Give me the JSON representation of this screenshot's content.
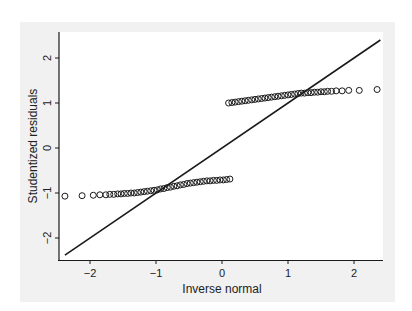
{
  "chart_data": {
    "type": "scatter",
    "title": "",
    "xlabel": "Inverse normal",
    "ylabel": "Studentized residuals",
    "xlim": [
      -2.55,
      2.45
    ],
    "ylim": [
      -2.5,
      2.6
    ],
    "xticks": [
      -2,
      -1,
      0,
      1,
      2
    ],
    "yticks": [
      -2,
      -1,
      0,
      1,
      2
    ],
    "xtick_labels": [
      "−2",
      "−1",
      "0",
      "1",
      "2"
    ],
    "ytick_labels": [
      "−2",
      "−1",
      "0",
      "1",
      "2"
    ],
    "grid": false,
    "legend": null,
    "marker": "hollow-circle",
    "reference_line": {
      "type": "line",
      "slope": 1,
      "intercept": 0,
      "from": [
        -2.38,
        -2.38
      ],
      "to": [
        2.4,
        2.4
      ]
    },
    "series": [
      {
        "name": "lower-cluster",
        "x": [
          -2.38,
          -2.12,
          -1.95,
          -1.85,
          -1.76,
          -1.7,
          -1.64,
          -1.58,
          -1.53,
          -1.48,
          -1.43,
          -1.38,
          -1.33,
          -1.28,
          -1.23,
          -1.18,
          -1.13,
          -1.08,
          -1.03,
          -0.98,
          -0.93,
          -0.88,
          -0.83,
          -0.78,
          -0.73,
          -0.68,
          -0.63,
          -0.58,
          -0.53,
          -0.48,
          -0.43,
          -0.38,
          -0.33,
          -0.28,
          -0.23,
          -0.18,
          -0.13,
          -0.08,
          -0.03,
          0.02,
          0.07,
          0.12
        ],
        "y": [
          -1.07,
          -1.06,
          -1.05,
          -1.04,
          -1.04,
          -1.03,
          -1.03,
          -1.02,
          -1.02,
          -1.01,
          -1.01,
          -1.0,
          -1.0,
          -0.99,
          -0.98,
          -0.97,
          -0.96,
          -0.95,
          -0.94,
          -0.93,
          -0.91,
          -0.9,
          -0.88,
          -0.87,
          -0.85,
          -0.84,
          -0.82,
          -0.81,
          -0.79,
          -0.78,
          -0.77,
          -0.76,
          -0.75,
          -0.74,
          -0.73,
          -0.73,
          -0.72,
          -0.72,
          -0.71,
          -0.71,
          -0.7,
          -0.69
        ]
      },
      {
        "name": "upper-cluster",
        "x": [
          0.1,
          0.15,
          0.2,
          0.25,
          0.3,
          0.35,
          0.4,
          0.45,
          0.5,
          0.55,
          0.6,
          0.65,
          0.7,
          0.75,
          0.8,
          0.85,
          0.9,
          0.95,
          1.0,
          1.05,
          1.1,
          1.15,
          1.2,
          1.25,
          1.3,
          1.35,
          1.4,
          1.45,
          1.5,
          1.55,
          1.6,
          1.66,
          1.73,
          1.82,
          1.92,
          2.08,
          2.35
        ],
        "y": [
          1.0,
          1.01,
          1.02,
          1.03,
          1.04,
          1.05,
          1.06,
          1.07,
          1.08,
          1.09,
          1.1,
          1.11,
          1.12,
          1.13,
          1.14,
          1.15,
          1.16,
          1.17,
          1.18,
          1.19,
          1.2,
          1.21,
          1.22,
          1.22,
          1.23,
          1.23,
          1.24,
          1.24,
          1.25,
          1.25,
          1.26,
          1.26,
          1.27,
          1.27,
          1.28,
          1.28,
          1.3
        ]
      }
    ]
  },
  "colors": {
    "panel_bg": "#f1f1f1",
    "plot_bg": "#ffffff",
    "ink": "#1a1a1a"
  }
}
